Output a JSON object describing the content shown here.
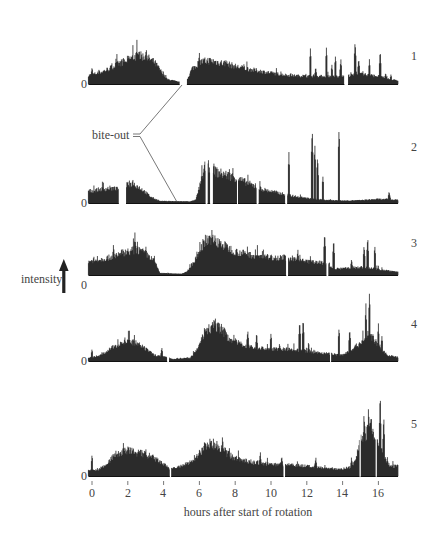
{
  "chart_data": {
    "type": "bar",
    "title": "",
    "xlabel": "hours after start of rotation",
    "ylabel": "intensity",
    "x_range": [
      -0.2,
      17.1
    ],
    "x_ticks": [
      0,
      2,
      4,
      6,
      8,
      10,
      12,
      14,
      16
    ],
    "x_tick_labels": [
      "0",
      "2",
      "4",
      "6",
      "8",
      "10",
      "12",
      "14",
      "16"
    ],
    "grid": false,
    "legend": null,
    "annotation": {
      "text": "bite-out",
      "points_to": [
        {
          "panel": 1,
          "hour": 4.9
        },
        {
          "panel": 2,
          "hour": 4.6
        }
      ]
    },
    "y_zero_label": "0",
    "series": [
      {
        "name": "1",
        "baseline_y": 84,
        "max_height": 40,
        "gaps": [
          [
            4.9,
            5.3
          ],
          [
            14.1,
            14.3
          ]
        ],
        "envelope": [
          [
            -0.2,
            0.22
          ],
          [
            0.5,
            0.3
          ],
          [
            1,
            0.4
          ],
          [
            1.5,
            0.52
          ],
          [
            2,
            0.62
          ],
          [
            2.5,
            0.72
          ],
          [
            3,
            0.7
          ],
          [
            3.5,
            0.55
          ],
          [
            3.9,
            0.3
          ],
          [
            4.2,
            0.12
          ],
          [
            4.9,
            0.05
          ],
          [
            5.3,
            0.1
          ],
          [
            5.6,
            0.4
          ],
          [
            6,
            0.55
          ],
          [
            6.5,
            0.6
          ],
          [
            7,
            0.56
          ],
          [
            7.5,
            0.52
          ],
          [
            8,
            0.45
          ],
          [
            9,
            0.36
          ],
          [
            10,
            0.28
          ],
          [
            11,
            0.22
          ],
          [
            12,
            0.2
          ],
          [
            13,
            0.2
          ],
          [
            14,
            0.2
          ],
          [
            15,
            0.25
          ],
          [
            16,
            0.2
          ],
          [
            17.1,
            0.08
          ]
        ],
        "spikes": [
          [
            0.0,
            0.45
          ],
          [
            0.4,
            0.4
          ],
          [
            1.9,
            0.6
          ],
          [
            2.6,
            0.85
          ],
          [
            3.0,
            0.8
          ],
          [
            6.0,
            0.85
          ],
          [
            7.5,
            0.6
          ],
          [
            10.0,
            0.3
          ],
          [
            11.1,
            0.32
          ],
          [
            12.2,
            0.95
          ],
          [
            12.5,
            0.45
          ],
          [
            13.1,
            0.95
          ],
          [
            13.4,
            0.5
          ],
          [
            13.6,
            0.75
          ],
          [
            13.9,
            0.65
          ],
          [
            14.7,
            1.15
          ],
          [
            14.9,
            0.7
          ],
          [
            15.5,
            0.65
          ],
          [
            16.1,
            0.85
          ],
          [
            16.4,
            0.3
          ],
          [
            16.7,
            0.25
          ]
        ]
      },
      {
        "name": "2",
        "baseline_y": 203,
        "max_height": 40,
        "gaps": [
          [
            1.5,
            1.9
          ],
          [
            6.35,
            6.45
          ],
          [
            6.6,
            6.75
          ],
          [
            8.1,
            8.15
          ],
          [
            9.2,
            9.3
          ],
          [
            10.8,
            10.9
          ]
        ],
        "envelope": [
          [
            -0.2,
            0.3
          ],
          [
            0.5,
            0.35
          ],
          [
            1,
            0.38
          ],
          [
            1.5,
            0.35
          ],
          [
            1.9,
            0.45
          ],
          [
            2.3,
            0.5
          ],
          [
            2.8,
            0.35
          ],
          [
            3.3,
            0.15
          ],
          [
            3.8,
            0.05
          ],
          [
            5.5,
            0.04
          ],
          [
            5.8,
            0.08
          ],
          [
            6.0,
            0.4
          ],
          [
            6.3,
            0.9
          ],
          [
            6.6,
            0.95
          ],
          [
            7.0,
            0.78
          ],
          [
            7.5,
            0.72
          ],
          [
            8,
            0.65
          ],
          [
            8.5,
            0.55
          ],
          [
            9,
            0.45
          ],
          [
            9.5,
            0.35
          ],
          [
            10.5,
            0.25
          ],
          [
            11,
            0.2
          ],
          [
            12,
            0.12
          ],
          [
            13,
            0.08
          ],
          [
            14,
            0.06
          ],
          [
            15,
            0.07
          ],
          [
            16,
            0.1
          ],
          [
            17.1,
            0.08
          ]
        ],
        "spikes": [
          [
            6.4,
            1.1
          ],
          [
            6.7,
            1.1
          ],
          [
            11.0,
            1.3
          ],
          [
            12.3,
            2.0
          ],
          [
            12.45,
            1.5
          ],
          [
            12.6,
            1.25
          ],
          [
            12.9,
            0.7
          ],
          [
            13.8,
            1.95
          ],
          [
            16.6,
            0.3
          ]
        ]
      },
      {
        "name": "3",
        "baseline_y": 275,
        "max_height": 40,
        "gaps": [
          [
            10.85,
            10.95
          ],
          [
            13.1,
            13.2
          ]
        ],
        "envelope": [
          [
            -0.2,
            0.35
          ],
          [
            0.5,
            0.4
          ],
          [
            1,
            0.45
          ],
          [
            1.5,
            0.55
          ],
          [
            2,
            0.6
          ],
          [
            2.5,
            0.65
          ],
          [
            3,
            0.55
          ],
          [
            3.5,
            0.35
          ],
          [
            3.8,
            0.05
          ],
          [
            5,
            0.03
          ],
          [
            5.3,
            0.08
          ],
          [
            5.8,
            0.4
          ],
          [
            6.2,
            0.8
          ],
          [
            6.6,
            0.95
          ],
          [
            7,
            0.85
          ],
          [
            7.5,
            0.72
          ],
          [
            8,
            0.6
          ],
          [
            9,
            0.5
          ],
          [
            10,
            0.45
          ],
          [
            10.8,
            0.45
          ],
          [
            11,
            0.4
          ],
          [
            12,
            0.35
          ],
          [
            13,
            0.3
          ],
          [
            13.5,
            0.15
          ],
          [
            15,
            0.2
          ],
          [
            16,
            0.15
          ],
          [
            17.1,
            0.08
          ]
        ],
        "spikes": [
          [
            0.1,
            0.5
          ],
          [
            1.2,
            0.8
          ],
          [
            2.4,
            1.1
          ],
          [
            6.7,
            1.2
          ],
          [
            11.5,
            0.7
          ],
          [
            12.2,
            0.5
          ],
          [
            13.0,
            1.15
          ],
          [
            13.5,
            0.9
          ],
          [
            14.5,
            0.4
          ],
          [
            15.2,
            0.8
          ],
          [
            15.4,
            1.0
          ],
          [
            15.8,
            0.75
          ]
        ]
      },
      {
        "name": "4",
        "baseline_y": 361,
        "max_height": 40,
        "gaps": [
          [
            4.2,
            4.3
          ],
          [
            13.3,
            13.35
          ]
        ],
        "envelope": [
          [
            -0.2,
            0.08
          ],
          [
            0.5,
            0.15
          ],
          [
            1,
            0.3
          ],
          [
            1.5,
            0.45
          ],
          [
            2,
            0.5
          ],
          [
            2.5,
            0.45
          ],
          [
            3,
            0.3
          ],
          [
            3.5,
            0.15
          ],
          [
            4.0,
            0.12
          ],
          [
            4.5,
            0.05
          ],
          [
            5.5,
            0.08
          ],
          [
            5.9,
            0.3
          ],
          [
            6.3,
            0.75
          ],
          [
            6.8,
            0.9
          ],
          [
            7.2,
            0.85
          ],
          [
            7.6,
            0.6
          ],
          [
            8.2,
            0.45
          ],
          [
            9,
            0.35
          ],
          [
            10,
            0.3
          ],
          [
            11,
            0.3
          ],
          [
            12,
            0.25
          ],
          [
            13,
            0.2
          ],
          [
            14,
            0.15
          ],
          [
            15,
            0.45
          ],
          [
            15.5,
            0.7
          ],
          [
            16,
            0.4
          ],
          [
            16.5,
            0.15
          ],
          [
            17.1,
            0.1
          ]
        ],
        "spikes": [
          [
            0.0,
            0.3
          ],
          [
            3.9,
            0.35
          ],
          [
            6.9,
            1.2
          ],
          [
            8.7,
            0.85
          ],
          [
            9.2,
            0.75
          ],
          [
            10.0,
            0.75
          ],
          [
            11.6,
            1.05
          ],
          [
            11.8,
            1.1
          ],
          [
            12.1,
            0.5
          ],
          [
            13.8,
            0.9
          ],
          [
            14.4,
            0.85
          ],
          [
            15.3,
            1.5
          ],
          [
            15.5,
            1.8
          ],
          [
            16.0,
            0.95
          ],
          [
            16.2,
            0.7
          ]
        ]
      },
      {
        "name": "5",
        "baseline_y": 476,
        "max_height": 40,
        "gaps": [
          [
            4.35,
            4.42
          ],
          [
            10.7,
            10.78
          ],
          [
            14.95,
            15.0
          ],
          [
            15.85,
            15.9
          ]
        ],
        "envelope": [
          [
            -0.2,
            0.15
          ],
          [
            0.3,
            0.15
          ],
          [
            0.8,
            0.3
          ],
          [
            1.3,
            0.55
          ],
          [
            2,
            0.65
          ],
          [
            2.5,
            0.6
          ],
          [
            3,
            0.55
          ],
          [
            3.5,
            0.45
          ],
          [
            4,
            0.3
          ],
          [
            4.3,
            0.2
          ],
          [
            4.5,
            0.2
          ],
          [
            5,
            0.25
          ],
          [
            5.5,
            0.35
          ],
          [
            6,
            0.6
          ],
          [
            6.5,
            0.85
          ],
          [
            7,
            0.8
          ],
          [
            7.5,
            0.6
          ],
          [
            8,
            0.45
          ],
          [
            9,
            0.35
          ],
          [
            10,
            0.3
          ],
          [
            10.7,
            0.28
          ],
          [
            11,
            0.3
          ],
          [
            12,
            0.25
          ],
          [
            13,
            0.2
          ],
          [
            14,
            0.18
          ],
          [
            14.6,
            0.25
          ],
          [
            15,
            0.9
          ],
          [
            15.5,
            1.2
          ],
          [
            16,
            0.9
          ],
          [
            16.3,
            0.55
          ],
          [
            16.6,
            0.25
          ],
          [
            17.1,
            0.25
          ]
        ],
        "spikes": [
          [
            0.0,
            0.55
          ],
          [
            1.8,
            0.75
          ],
          [
            3.0,
            0.75
          ],
          [
            6.6,
            1.05
          ],
          [
            7.3,
            1.05
          ],
          [
            9.4,
            0.65
          ],
          [
            10.6,
            0.55
          ],
          [
            12.5,
            0.5
          ],
          [
            14.5,
            0.5
          ],
          [
            15.2,
            1.6
          ],
          [
            15.45,
            1.85
          ],
          [
            15.6,
            1.7
          ],
          [
            16.1,
            2.1
          ],
          [
            16.3,
            1.6
          ]
        ]
      }
    ]
  },
  "labels": {
    "panels": [
      "1",
      "2",
      "3",
      "4",
      "5"
    ],
    "zero": "0",
    "bite_out": "bite-out",
    "intensity": "intensity",
    "xlabel": "hours after start of rotation",
    "ticks": [
      "0",
      "2",
      "4",
      "6",
      "8",
      "10",
      "12",
      "14",
      "16"
    ]
  },
  "colors": {
    "fill": "#111111",
    "line": "#555555",
    "text": "#444444"
  }
}
